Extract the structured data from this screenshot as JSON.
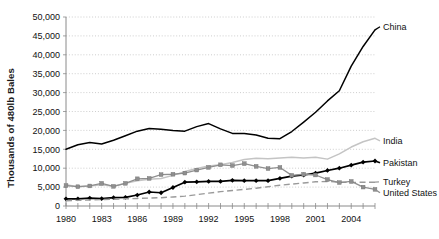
{
  "chart_data": {
    "type": "line",
    "title": "",
    "xlabel": "",
    "ylabel": "Thousands of 480lb Bales",
    "xlim": [
      1980,
      2006
    ],
    "ylim": [
      0,
      50000
    ],
    "grid": true,
    "legend_position": "right-inline-labels",
    "y_ticks": [
      "0",
      "5,000",
      "10,000",
      "15,000",
      "20,000",
      "25,000",
      "30,000",
      "35,000",
      "40,000",
      "45,000",
      "50,000"
    ],
    "y_tick_values": [
      0,
      5000,
      10000,
      15000,
      20000,
      25000,
      30000,
      35000,
      40000,
      45000,
      50000
    ],
    "x_ticks": [
      "1980",
      "1983",
      "1986",
      "1989",
      "1992",
      "1995",
      "1998",
      "2001",
      "2004"
    ],
    "x_tick_values": [
      1980,
      1983,
      1986,
      1989,
      1992,
      1995,
      1998,
      2001,
      2004
    ],
    "x": [
      1980,
      1981,
      1982,
      1983,
      1984,
      1985,
      1986,
      1987,
      1988,
      1989,
      1990,
      1991,
      1992,
      1993,
      1994,
      1995,
      1996,
      1997,
      1998,
      1999,
      2000,
      2001,
      2002,
      2003,
      2004,
      2005,
      2006
    ],
    "series": [
      {
        "name": "China",
        "color": "#000000",
        "style": "solid",
        "marker": "none",
        "label_at_end": "China",
        "values": [
          15000,
          16200,
          16800,
          16400,
          17400,
          18600,
          19800,
          20500,
          20300,
          20000,
          19800,
          21000,
          21800,
          20400,
          19200,
          19200,
          18800,
          17900,
          17800,
          19700,
          22200,
          24800,
          27800,
          30500,
          37000,
          42200,
          46600
        ]
      },
      {
        "name": "India",
        "color": "#c4c4c4",
        "style": "solid",
        "marker": "none",
        "label_at_end": "India",
        "values": [
          5600,
          5100,
          5300,
          5600,
          5200,
          6000,
          6700,
          7100,
          7300,
          8100,
          9100,
          9900,
          10600,
          10900,
          11500,
          12300,
          12600,
          12500,
          12700,
          12900,
          12700,
          12900,
          12400,
          13800,
          15600,
          17000,
          17900
        ]
      },
      {
        "name": "Pakistan",
        "color": "#000000",
        "style": "solid",
        "marker": "diamond",
        "label_at_end": "Pakistan",
        "values": [
          1900,
          1900,
          2100,
          1950,
          2200,
          2300,
          2900,
          3700,
          3500,
          4900,
          6300,
          6400,
          6500,
          6500,
          6800,
          6700,
          6700,
          6700,
          7300,
          7900,
          8200,
          8700,
          9400,
          10000,
          10800,
          11600,
          11900
        ]
      },
      {
        "name": "Turkey",
        "color": "#9a9a9a",
        "style": "dashed",
        "marker": "none",
        "label_at_end": "Turkey",
        "values": [
          1400,
          1500,
          1600,
          1700,
          1800,
          1900,
          2000,
          2100,
          2200,
          2400,
          2600,
          3000,
          3400,
          3800,
          4100,
          4400,
          4700,
          5100,
          5500,
          5800,
          6100,
          6400,
          6500,
          6300,
          6200,
          6300,
          6300
        ]
      },
      {
        "name": "United States",
        "color": "#8f8f8f",
        "style": "solid",
        "marker": "square",
        "label_at_end": "United States",
        "values": [
          5400,
          5100,
          5300,
          6000,
          5200,
          6000,
          7200,
          7300,
          8300,
          8400,
          8700,
          9500,
          10200,
          10900,
          10700,
          11200,
          10500,
          9900,
          10200,
          8100,
          8400,
          8200,
          7000,
          6200,
          6500,
          5000,
          4400
        ]
      }
    ]
  },
  "axis": {
    "y_title": "Thousands of 480lb Bales"
  }
}
